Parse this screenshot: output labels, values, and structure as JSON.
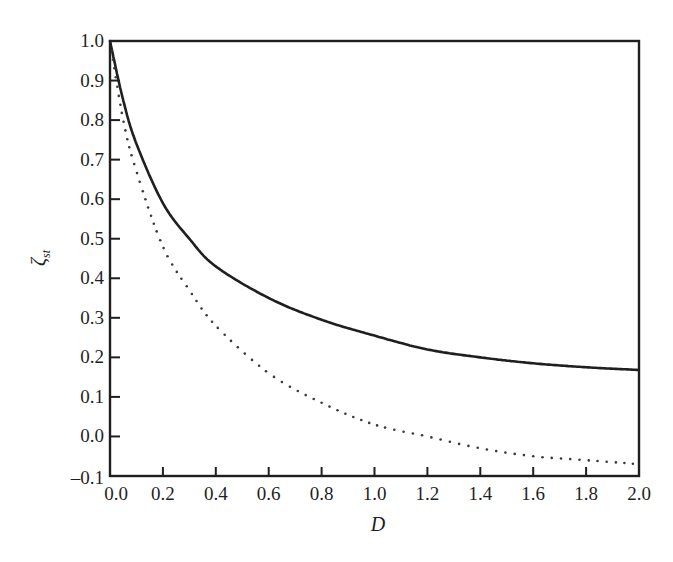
{
  "chart_data": {
    "type": "line",
    "title": "",
    "xlabel": "D",
    "ylabel": "ζ_st",
    "ylabel_main": "ζ",
    "ylabel_sub": "st",
    "xlim": [
      0.0,
      2.0
    ],
    "ylim": [
      -0.1,
      1.0
    ],
    "grid": false,
    "legend": null,
    "x_ticks": [
      "0.0",
      "0.2",
      "0.4",
      "0.6",
      "0.8",
      "1.0",
      "1.2",
      "1.4",
      "1.6",
      "1.8",
      "2.0"
    ],
    "y_ticks": [
      "1.0",
      "0.9",
      "0.8",
      "0.7",
      "0.6",
      "0.5",
      "0.4",
      "0.3",
      "0.2",
      "0.1",
      "0.0",
      "–0.1"
    ],
    "x": [
      0.0,
      0.05,
      0.1,
      0.2,
      0.3,
      0.4,
      0.6,
      0.8,
      1.0,
      1.2,
      1.4,
      1.6,
      1.8,
      2.0
    ],
    "series": [
      {
        "name": "solid",
        "style": "solid",
        "values": [
          1.0,
          0.85,
          0.74,
          0.59,
          0.5,
          0.43,
          0.35,
          0.295,
          0.255,
          0.22,
          0.2,
          0.185,
          0.175,
          0.168
        ]
      },
      {
        "name": "dotted",
        "style": "dotted",
        "values": [
          1.0,
          0.8,
          0.67,
          0.48,
          0.37,
          0.28,
          0.16,
          0.085,
          0.03,
          0.0,
          -0.03,
          -0.05,
          -0.06,
          -0.07
        ]
      }
    ]
  }
}
